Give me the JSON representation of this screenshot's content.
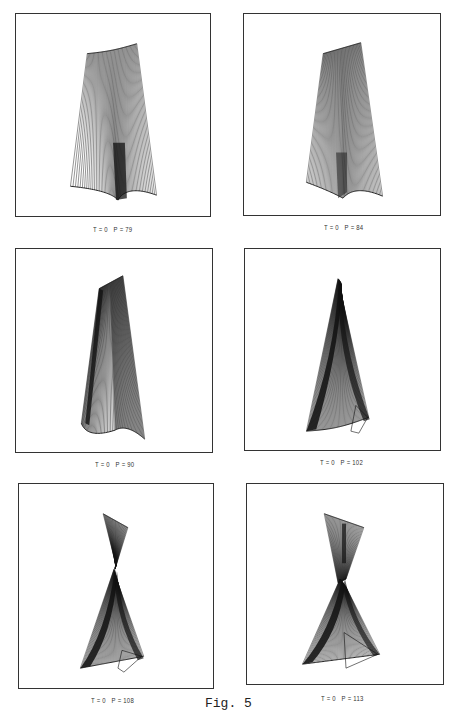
{
  "figure": {
    "label": "Fig. 5",
    "line_color": "#111111",
    "frame_color": "#333333"
  },
  "panels": [
    {
      "caption": "T = 0   P = 79",
      "T": 0,
      "P": 79,
      "shape": "wide-fan"
    },
    {
      "caption": "T = 0   P = 84",
      "T": 0,
      "P": 84,
      "shape": "fan-dense"
    },
    {
      "caption": "T = 0   P = 90",
      "T": 0,
      "P": 90,
      "shape": "narrow-slab"
    },
    {
      "caption": "T = 0   P = 102",
      "T": 0,
      "P": 102,
      "shape": "spike"
    },
    {
      "caption": "T = 0   P = 108",
      "T": 0,
      "P": 108,
      "shape": "twisted-hourglass"
    },
    {
      "caption": "T = 0   P = 113",
      "T": 0,
      "P": 113,
      "shape": "twisted-hourglass-wide"
    }
  ]
}
